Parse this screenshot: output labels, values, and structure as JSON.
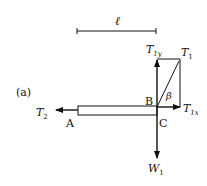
{
  "diagram": {
    "panel_label": "(a)",
    "length_label": "ℓ",
    "points": {
      "A": "A",
      "B": "B",
      "C": "C"
    },
    "forces": {
      "T1y": {
        "main": "T",
        "sub": "1y"
      },
      "T1": {
        "main": "T",
        "sub": "1"
      },
      "T1x": {
        "main": "T",
        "sub": "1x"
      },
      "T2": {
        "main": "T",
        "sub": "2"
      },
      "W1": {
        "main": "W",
        "sub": "1"
      }
    },
    "angle_label": "β",
    "colors": {
      "stroke": "#111111",
      "background": "#ffffff"
    }
  }
}
